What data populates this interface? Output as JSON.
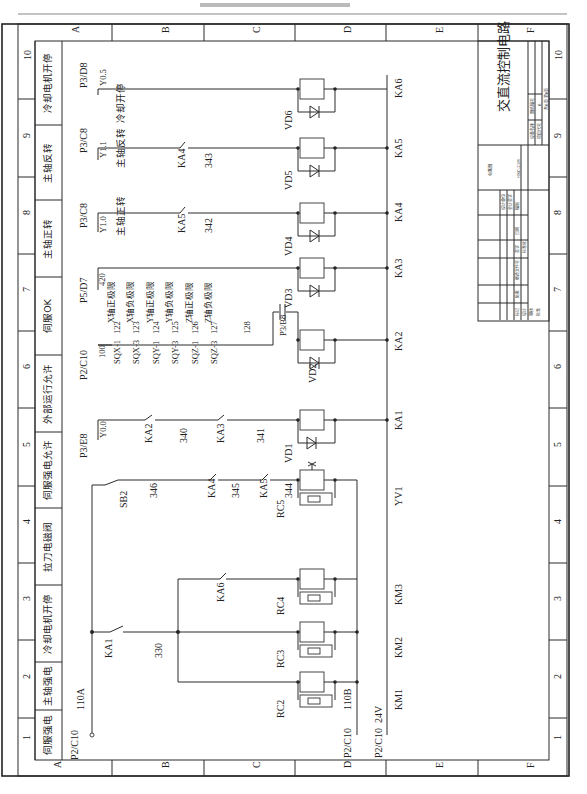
{
  "page": {
    "orientation": "rotated-90-ccw",
    "header_line_text": ""
  },
  "frame": {
    "row_labels": [
      "A",
      "B",
      "C",
      "D",
      "E",
      "F"
    ],
    "column_numbers": [
      "1",
      "2",
      "3",
      "4",
      "5",
      "6",
      "7",
      "8",
      "9",
      "10"
    ]
  },
  "function_headers": [
    {
      "col": "1",
      "label": "伺服强电"
    },
    {
      "col": "2",
      "label": "主轴强电"
    },
    {
      "col": "3",
      "label": "冷却电机开停"
    },
    {
      "col": "4",
      "label": "拉刀电磁阀"
    },
    {
      "col": "5",
      "label": "伺服强电允许"
    },
    {
      "col": "6",
      "label": "外部运行允许"
    },
    {
      "col": "7",
      "label": "伺服OK"
    },
    {
      "col": "8",
      "label": "主轴正转"
    },
    {
      "col": "9",
      "label": "主轴反转"
    },
    {
      "col": "10",
      "label": "冷却电机开停"
    }
  ],
  "references": {
    "p2c10_top": "P2/C10",
    "p3e8": "P3/E8",
    "p2c10_ext": "P2/C10",
    "p5d7": "P5/D7",
    "p3c8_a": "P3/C8",
    "p3c8_b": "P3/C8",
    "p3d8": "P3/D8",
    "p3b8": "P3/B8",
    "p2c10_110b": "P2/C10",
    "p2c10_24v": "P2/C10"
  },
  "io_points": {
    "y00": "Y0.0",
    "y10": "Y1.0",
    "y11": "Y1.1",
    "y05": "Y0.5"
  },
  "wire_numbers": {
    "w110a": "110A",
    "w110b": "110B",
    "w24v": "24V",
    "w330": "330",
    "w346": "346",
    "w345": "345",
    "w344": "344",
    "w340": "340",
    "w341": "341",
    "w100": "100",
    "w122": "122",
    "w123": "123",
    "w124": "124",
    "w125": "125",
    "w126": "126",
    "w127": "127",
    "w128": "128",
    "w420": "420",
    "w342": "342",
    "w343": "343"
  },
  "signal_labels": {
    "spindle_fwd": "主轴正转",
    "spindle_rev": "主轴反转",
    "coolant": "冷却开停",
    "x_pos": "X轴正极限",
    "x_neg": "X轴负极限",
    "y_pos": "Y轴正极限",
    "y_neg": "Y轴负极限",
    "z_pos": "Z轴正极限",
    "z_neg": "Z轴负极限"
  },
  "components": {
    "ka1_contact": "KA1",
    "sb2": "SB2",
    "ka4_contact": "KA4",
    "ka5_contact": "KA5",
    "ka6_contact": "KA6",
    "ka2_contact": "KA2",
    "ka3_contact": "KA3",
    "ka5_contact_b": "KA5",
    "ka4_contact_b": "KA4",
    "sqx1": "SQX-1",
    "sqx3": "SQX-3",
    "sqy1": "SQY-1",
    "sqy3": "SQY-3",
    "sqz1": "SQZ-1",
    "sqz3": "SQZ-3",
    "rc2": "RC2",
    "rc3": "RC3",
    "rc4": "RC4",
    "rc5": "RC5",
    "vd1": "VD1",
    "vd2": "VD2",
    "vd3": "VD3",
    "vd4": "VD4",
    "vd5": "VD5",
    "vd6": "VD6"
  },
  "coil_labels": [
    "KM1",
    "KM2",
    "KM3",
    "YV1",
    "KA1",
    "KA2",
    "KA3",
    "KA4",
    "KA5",
    "KA6"
  ],
  "title_block": {
    "drawing_title": "交直流控制电路",
    "drawing_type": "电路图",
    "model": "HNC-21M",
    "sheet_number": "6",
    "sheet_info": "共6页 第6页",
    "label_design_name": "设备名称",
    "label_project_code": "项目代号",
    "label_drawing_no": "图纸编号",
    "cells_small": [
      "设计单位",
      "会计签字",
      "编制",
      "标记",
      "处数",
      "更改文件号",
      "签字",
      "日期",
      "设计",
      "审核",
      "批准",
      "标准化"
    ]
  }
}
